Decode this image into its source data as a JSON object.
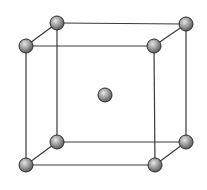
{
  "diagram": {
    "type": "crystal-lattice",
    "colors": {
      "background": "#ffffff",
      "edge": "#3a3a3a",
      "atom_fill_light": "#e6e6e6",
      "atom_fill_mid": "#9a9a9a",
      "atom_fill_dark": "#5a5a5a",
      "atom_outline": "#2e2e2e"
    },
    "atom_radius": 7,
    "atoms": [
      {
        "id": "back-top-left",
        "x": 57,
        "y": 23
      },
      {
        "id": "back-top-right",
        "x": 186,
        "y": 24
      },
      {
        "id": "front-top-left",
        "x": 26,
        "y": 46
      },
      {
        "id": "front-top-right",
        "x": 154,
        "y": 46
      },
      {
        "id": "back-bottom-left",
        "x": 57,
        "y": 142
      },
      {
        "id": "back-bottom-right",
        "x": 186,
        "y": 142
      },
      {
        "id": "front-bottom-left",
        "x": 26,
        "y": 165
      },
      {
        "id": "front-bottom-right",
        "x": 155,
        "y": 165
      },
      {
        "id": "body-center",
        "x": 105,
        "y": 95
      }
    ],
    "edges": [
      [
        "back-top-left",
        "back-top-right"
      ],
      [
        "back-top-left",
        "front-top-left"
      ],
      [
        "back-top-right",
        "front-top-right"
      ],
      [
        "front-top-left",
        "front-top-right"
      ],
      [
        "back-bottom-left",
        "back-bottom-right"
      ],
      [
        "back-bottom-left",
        "front-bottom-left"
      ],
      [
        "back-bottom-right",
        "front-bottom-right"
      ],
      [
        "front-bottom-left",
        "front-bottom-right"
      ],
      [
        "back-top-left",
        "back-bottom-left"
      ],
      [
        "back-top-right",
        "back-bottom-right"
      ],
      [
        "front-top-left",
        "front-bottom-left"
      ],
      [
        "front-top-right",
        "front-bottom-right"
      ]
    ]
  }
}
